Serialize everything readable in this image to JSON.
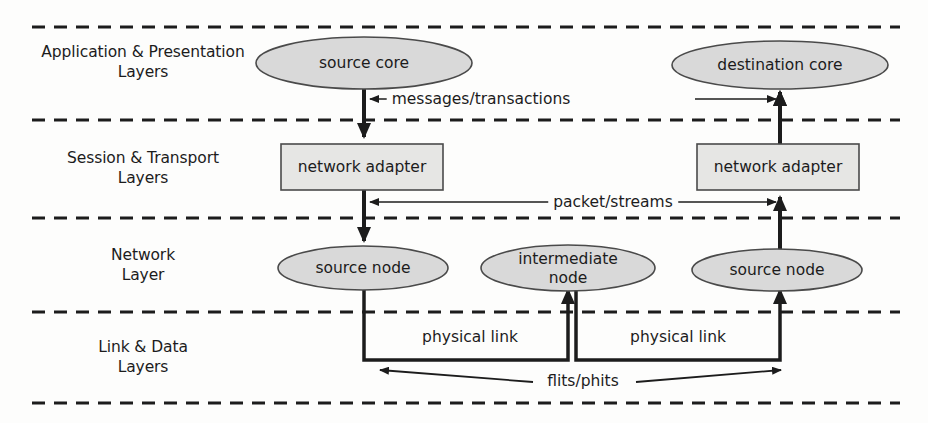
{
  "diagram": {
    "background_color": "#fdfdfc",
    "node_fill_color": "#d9d9d9",
    "line_color": "#1c1c1c"
  },
  "layers": [
    {
      "id": "application",
      "label": "Application & Presentation\nLayers"
    },
    {
      "id": "session",
      "label": "Session & Transport\nLayers"
    },
    {
      "id": "network",
      "label": "Network\nLayer"
    },
    {
      "id": "link",
      "label": "Link & Data\nLayers"
    }
  ],
  "nodes": [
    {
      "id": "source-core",
      "shape": "ellipse",
      "label": "source core"
    },
    {
      "id": "destination-core",
      "shape": "ellipse",
      "label": "destination core"
    },
    {
      "id": "network-adapter-left",
      "shape": "rect",
      "label": "network adapter"
    },
    {
      "id": "network-adapter-right",
      "shape": "rect",
      "label": "network adapter"
    },
    {
      "id": "source-node-left",
      "shape": "ellipse",
      "label": "source node"
    },
    {
      "id": "intermediate-node",
      "shape": "ellipse",
      "label": "intermediate\nnode"
    },
    {
      "id": "source-node-right",
      "shape": "ellipse",
      "label": "source node"
    }
  ],
  "edge_labels": [
    {
      "id": "messages-transactions",
      "label": "messages/transactions"
    },
    {
      "id": "packet-streams",
      "label": "packet/streams"
    },
    {
      "id": "physical-link-left",
      "label": "physical link"
    },
    {
      "id": "physical-link-right",
      "label": "physical link"
    },
    {
      "id": "flits-phits",
      "label": "flits/phits"
    }
  ]
}
